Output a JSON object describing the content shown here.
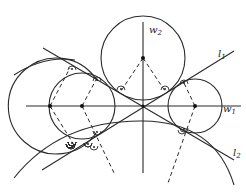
{
  "diagram": {
    "labels": {
      "w1": {
        "main": "w",
        "sub": "1"
      },
      "w2": {
        "main": "w",
        "sub": "2"
      },
      "l1": {
        "main": "l",
        "sub": "1"
      },
      "l2": {
        "main": "l",
        "sub": "2"
      }
    },
    "colors": {
      "stroke": "#2a2a2a",
      "background": "#ffffff"
    }
  }
}
